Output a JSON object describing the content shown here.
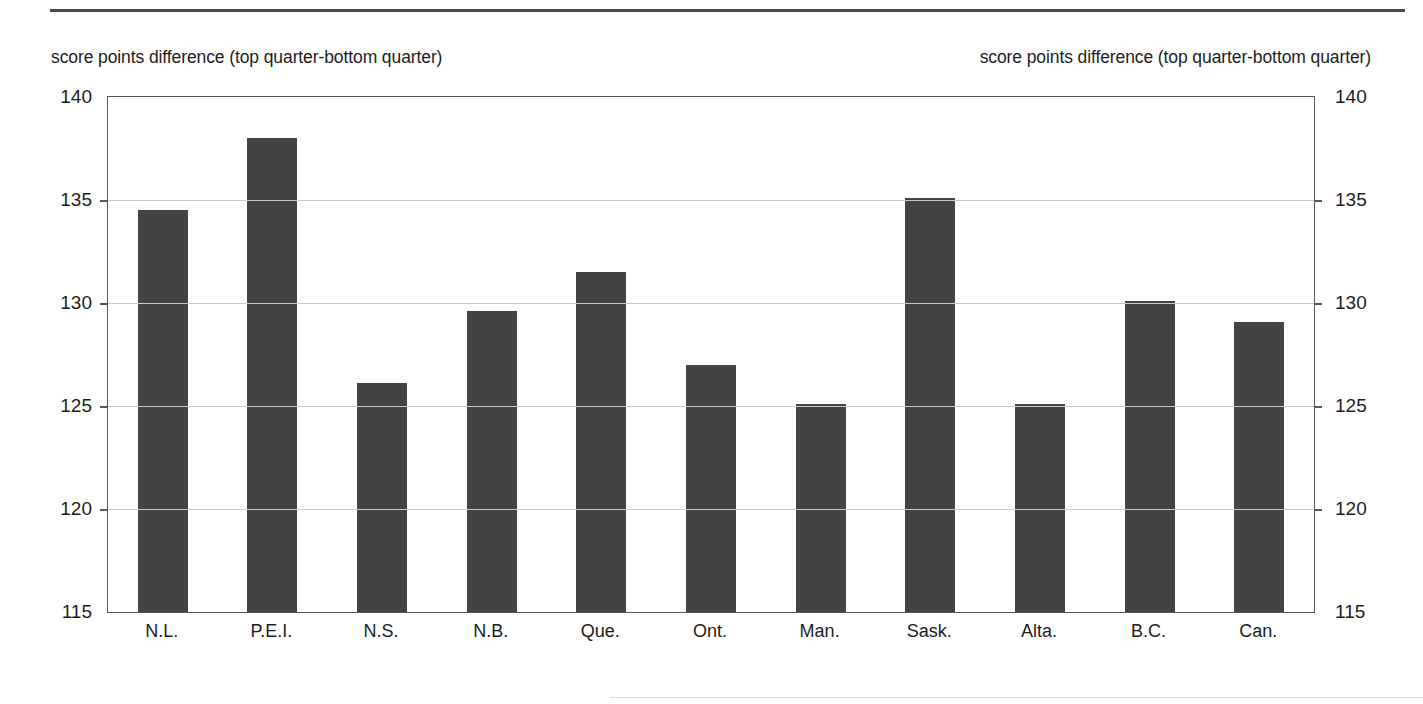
{
  "chart_data": {
    "type": "bar",
    "title": "",
    "subtitle": "",
    "xlabel": "",
    "ylabel": "score points difference (top quarter-bottom quarter)",
    "ylabel_right": "score points difference (top quarter-bottom quarter)",
    "ylim": [
      115,
      140
    ],
    "yticks": [
      115,
      120,
      125,
      130,
      135,
      140
    ],
    "ytick_labels": [
      "115",
      "120",
      "125",
      "130",
      "135",
      "140"
    ],
    "grid": true,
    "grid_axis": "y",
    "legend": "none",
    "dual_axis": true,
    "bar_color": "#434343",
    "categories": [
      "N.L.",
      "P.E.I.",
      "N.S.",
      "N.B.",
      "Que.",
      "Ont.",
      "Man.",
      "Sask.",
      "Alta.",
      "B.C.",
      "Can."
    ],
    "values": [
      134.5,
      138.0,
      126.1,
      129.6,
      131.5,
      127.0,
      125.1,
      135.1,
      125.1,
      130.1,
      129.1
    ]
  },
  "captions": {
    "left": "score points difference (top quarter-bottom quarter)",
    "right": "score points difference (top quarter-bottom quarter)"
  }
}
